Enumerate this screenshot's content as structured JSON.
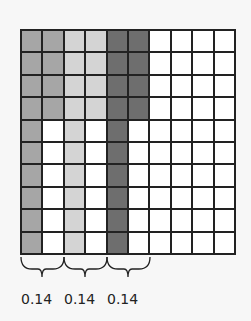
{
  "grid": {
    "rows": 10,
    "cols": 10,
    "colors": {
      "medium": "#a6a6a6",
      "light": "#d4d4d4",
      "dark": "#6e6e6e",
      "empty": "#ffffff"
    },
    "shading": [
      {
        "col": 0,
        "rows": 10,
        "shade": "medium"
      },
      {
        "col": 1,
        "rows": 4,
        "shade": "medium"
      },
      {
        "col": 2,
        "rows": 10,
        "shade": "light"
      },
      {
        "col": 3,
        "rows": 4,
        "shade": "light"
      },
      {
        "col": 4,
        "rows": 10,
        "shade": "dark"
      },
      {
        "col": 5,
        "rows": 4,
        "shade": "dark"
      }
    ]
  },
  "labels": [
    {
      "text": "0.14",
      "left": 21
    },
    {
      "text": "0.14",
      "left": 64
    },
    {
      "text": "0.14",
      "left": 107
    }
  ]
}
